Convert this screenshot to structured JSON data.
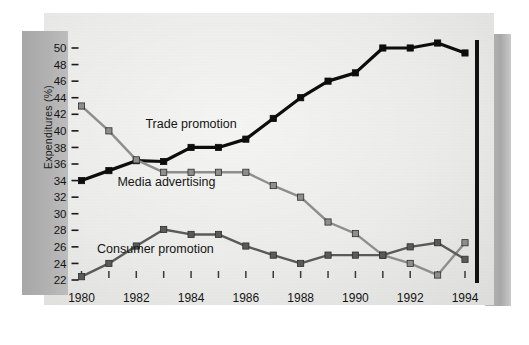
{
  "chart_data": {
    "type": "line",
    "title": "",
    "subtitle": "",
    "xlabel": "",
    "ylabel": "Expenditures (%)",
    "xlim": [
      1980,
      1994
    ],
    "ylim": [
      22,
      50
    ],
    "yticks": [
      22,
      24,
      26,
      28,
      30,
      32,
      34,
      36,
      38,
      40,
      42,
      44,
      46,
      48,
      50
    ],
    "xticks": [
      1980,
      1981,
      1982,
      1983,
      1984,
      1985,
      1986,
      1987,
      1988,
      1989,
      1990,
      1991,
      1992,
      1993,
      1994
    ],
    "xtick_labels": [
      "1980",
      "",
      "1982",
      "",
      "1984",
      "",
      "1986",
      "",
      "1988",
      "",
      "1990",
      "",
      "1992",
      "",
      "1994"
    ],
    "grid": false,
    "legend": "inline-annotations",
    "x": [
      1980,
      1981,
      1982,
      1983,
      1984,
      1985,
      1986,
      1987,
      1988,
      1989,
      1990,
      1991,
      1992,
      1993,
      1994
    ],
    "series": [
      {
        "name": "Trade promotion",
        "color": "#0d0d0d",
        "marker": "square",
        "values": [
          34.0,
          35.2,
          36.4,
          36.3,
          38.0,
          38.0,
          39.0,
          41.5,
          44.0,
          46.0,
          47.0,
          50.0,
          50.0,
          50.6,
          49.4
        ]
      },
      {
        "name": "Media advertising",
        "color": "#8e8e8e",
        "marker": "square",
        "values": [
          43.0,
          40.0,
          36.5,
          35.0,
          35.0,
          35.0,
          35.0,
          33.4,
          32.0,
          29.0,
          27.6,
          25.0,
          24.0,
          22.6,
          26.5
        ]
      },
      {
        "name": "Consumer promotion",
        "color": "#5a5a5a",
        "marker": "square",
        "values": [
          22.4,
          24.0,
          26.1,
          28.1,
          27.5,
          27.5,
          26.1,
          25.0,
          24.0,
          25.0,
          25.0,
          25.0,
          26.0,
          26.5,
          24.5
        ]
      }
    ],
    "annotations": [
      {
        "text": "Trade promotion",
        "x": 1984.0,
        "y": 40.4
      },
      {
        "text": "Media advertising",
        "x": 1983.1,
        "y": 33.3
      },
      {
        "text": "Consumer promotion",
        "x": 1982.7,
        "y": 25.2
      }
    ]
  },
  "colors": {
    "trade_promotion": "#0d0d0d",
    "media_advertising": "#8e8e8e",
    "consumer_promotion": "#5a5a5a",
    "page_background": "#e9e9e7",
    "frame_band": "#b2b2b2",
    "axis": "#111111"
  }
}
